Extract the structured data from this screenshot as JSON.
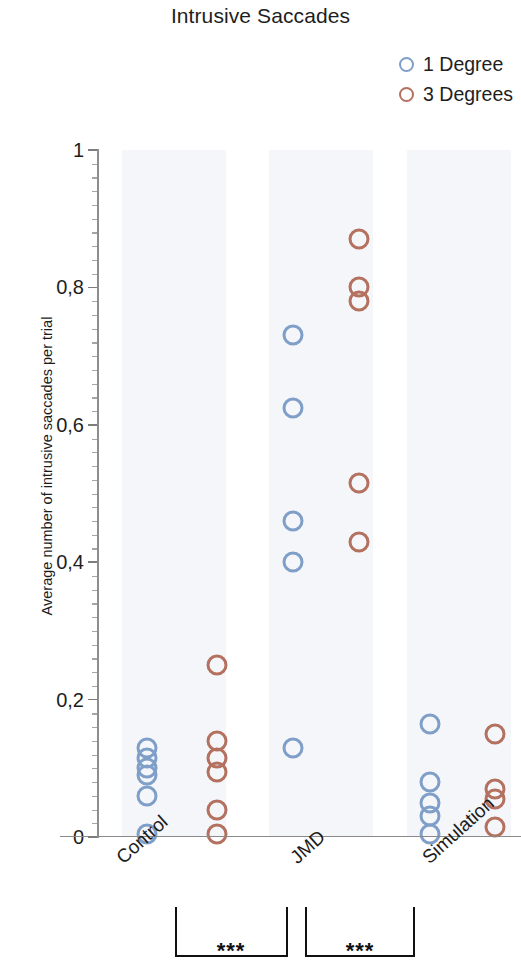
{
  "chart_data": {
    "type": "scatter",
    "title": "Intrusive Saccades",
    "xlabel": "",
    "ylabel": "Average number of intrusive saccades per trial",
    "ylim": [
      0,
      1
    ],
    "ytick_labels": [
      "0",
      "0,2",
      "0,4",
      "0,6",
      "0,8",
      "1"
    ],
    "ytick_values": [
      0,
      0.2,
      0.4,
      0.6,
      0.8,
      1
    ],
    "yminor_step": 0.02,
    "grid": false,
    "legend_position": "top-right",
    "categories": [
      "Control",
      "JMD",
      "Simulation"
    ],
    "series": [
      {
        "name": "1 Degree",
        "color": "#7f9fc8",
        "points": [
          {
            "category": "Control",
            "values": [
              0.13,
              0.115,
              0.1,
              0.09,
              0.06,
              0.005
            ]
          },
          {
            "category": "JMD",
            "values": [
              0.73,
              0.625,
              0.46,
              0.4,
              0.13
            ]
          },
          {
            "category": "Simulation",
            "values": [
              0.165,
              0.08,
              0.05,
              0.03,
              0.005
            ]
          }
        ]
      },
      {
        "name": "3 Degrees",
        "color": "#b4715f",
        "points": [
          {
            "category": "Control",
            "values": [
              0.25,
              0.14,
              0.115,
              0.095,
              0.04,
              0.005
            ]
          },
          {
            "category": "JMD",
            "values": [
              0.87,
              0.8,
              0.78,
              0.515,
              0.43
            ]
          },
          {
            "category": "Simulation",
            "values": [
              0.15,
              0.07,
              0.055,
              0.015
            ]
          }
        ]
      }
    ],
    "annotations": [
      {
        "type": "significance-bracket",
        "from": "Control",
        "to": "JMD",
        "label": "***"
      },
      {
        "type": "significance-bracket",
        "from": "JMD",
        "to": "Simulation",
        "label": "***"
      }
    ]
  },
  "legend": {
    "items": [
      {
        "label": "1 Degree",
        "color": "#7f9fc8"
      },
      {
        "label": "3 Degrees",
        "color": "#b4715f"
      }
    ]
  }
}
